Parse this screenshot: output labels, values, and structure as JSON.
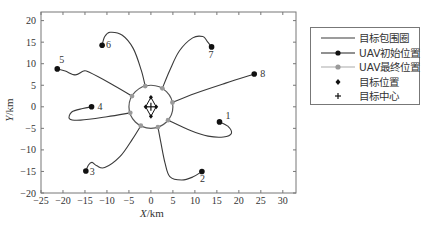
{
  "chart_data": {
    "type": "line",
    "title": "",
    "xlabel": "X/km",
    "ylabel": "Y/km",
    "xlim": [
      -25,
      33
    ],
    "ylim": [
      -20,
      22
    ],
    "xticks": [
      -25,
      -20,
      -15,
      -10,
      -5,
      0,
      5,
      10,
      15,
      20,
      25,
      30
    ],
    "yticks": [
      -20,
      -15,
      -10,
      -5,
      0,
      5,
      10,
      15,
      20
    ],
    "grid": false,
    "legend_position": "right-outside",
    "legend": [
      "目标包围圈",
      "UAV初始位置",
      "UAV最终位置",
      "目标位置",
      "目标中心"
    ],
    "encirclement_circle": {
      "center": [
        0,
        0
      ],
      "radius_km": 5
    },
    "target_center": [
      0,
      0
    ],
    "target_positions": [
      [
        0,
        2.2
      ],
      [
        0,
        -2.2
      ],
      [
        -1.2,
        0
      ],
      [
        1.2,
        0
      ]
    ],
    "uav_initial_positions": [
      {
        "id": "1",
        "x": 15.6,
        "y": -3.5
      },
      {
        "id": "2",
        "x": 11.6,
        "y": -15.0
      },
      {
        "id": "3",
        "x": -14.8,
        "y": -14.9
      },
      {
        "id": "4",
        "x": -13.5,
        "y": 0.0
      },
      {
        "id": "5",
        "x": -21.3,
        "y": 8.8
      },
      {
        "id": "6",
        "x": -11.1,
        "y": 14.3
      },
      {
        "id": "7",
        "x": 13.8,
        "y": 13.9
      },
      {
        "id": "8",
        "x": 23.5,
        "y": 7.6
      }
    ],
    "uav_final_positions": [
      {
        "id": "1",
        "x": 3.9,
        "y": -3.1
      },
      {
        "id": "2",
        "x": 1.6,
        "y": -4.7
      },
      {
        "id": "3",
        "x": -2.3,
        "y": -4.4
      },
      {
        "id": "4",
        "x": -4.7,
        "y": -1.4
      },
      {
        "id": "5",
        "x": -4.3,
        "y": 2.5
      },
      {
        "id": "6",
        "x": -1.3,
        "y": 4.8
      },
      {
        "id": "7",
        "x": 2.6,
        "y": 4.3
      },
      {
        "id": "8",
        "x": 4.9,
        "y": 1.0
      }
    ],
    "trajectories": [
      {
        "id": "1",
        "points": [
          [
            15.6,
            -3.5
          ],
          [
            17.5,
            -4.5
          ],
          [
            18.3,
            -6.2
          ],
          [
            16.5,
            -7.0
          ],
          [
            13,
            -6.8
          ],
          [
            9,
            -5.5
          ],
          [
            3.9,
            -3.1
          ]
        ]
      },
      {
        "id": "2",
        "points": [
          [
            11.6,
            -15.0
          ],
          [
            9.5,
            -16.3
          ],
          [
            7,
            -17.0
          ],
          [
            4.3,
            -16.2
          ],
          [
            3.2,
            -13
          ],
          [
            2.3,
            -8.5
          ],
          [
            1.6,
            -4.7
          ]
        ]
      },
      {
        "id": "3",
        "points": [
          [
            -14.8,
            -14.9
          ],
          [
            -14.2,
            -13.5
          ],
          [
            -13.4,
            -12.9
          ],
          [
            -12.3,
            -13.7
          ],
          [
            -10.5,
            -14.1
          ],
          [
            -7,
            -11.5
          ],
          [
            -4.2,
            -7.5
          ],
          [
            -2.3,
            -4.4
          ]
        ]
      },
      {
        "id": "4",
        "points": [
          [
            -13.5,
            0.0
          ],
          [
            -15.5,
            -0.4
          ],
          [
            -18,
            -1.2
          ],
          [
            -18.5,
            -2.8
          ],
          [
            -16,
            -3.1
          ],
          [
            -10,
            -2.3
          ],
          [
            -4.7,
            -1.4
          ]
        ]
      },
      {
        "id": "5",
        "points": [
          [
            -21.3,
            8.8
          ],
          [
            -19.5,
            8.3
          ],
          [
            -17.2,
            7.4
          ],
          [
            -15.3,
            8.3
          ],
          [
            -14.0,
            8.0
          ],
          [
            -9,
            5.3
          ],
          [
            -4.3,
            2.5
          ]
        ]
      },
      {
        "id": "6",
        "points": [
          [
            -11.1,
            14.3
          ],
          [
            -10.5,
            16.3
          ],
          [
            -9.3,
            17.3
          ],
          [
            -6.5,
            16.6
          ],
          [
            -4,
            13.5
          ],
          [
            -2.2,
            8.5
          ],
          [
            -1.3,
            4.8
          ]
        ]
      },
      {
        "id": "7",
        "points": [
          [
            13.8,
            13.9
          ],
          [
            12.8,
            15.2
          ],
          [
            11.8,
            16.3
          ],
          [
            9.5,
            16.0
          ],
          [
            6.5,
            13.0
          ],
          [
            4.3,
            8.5
          ],
          [
            2.6,
            4.3
          ]
        ]
      },
      {
        "id": "8",
        "points": [
          [
            23.5,
            7.6
          ],
          [
            17,
            5.5
          ],
          [
            10,
            3.1
          ],
          [
            4.9,
            1.0
          ]
        ]
      }
    ]
  },
  "axes": {
    "x_title_var": "X",
    "x_title_unit": "/km",
    "y_title_var": "Y",
    "y_title_unit": "/km"
  },
  "legend": {
    "items": [
      {
        "label": "目标包围圈",
        "symbol": "line-black"
      },
      {
        "label": "UAV初始位置",
        "symbol": "line-black-dot"
      },
      {
        "label": "UAV最终位置",
        "symbol": "line-gray-dot"
      },
      {
        "label": "目标位置",
        "symbol": "diamond-black"
      },
      {
        "label": "目标中心",
        "symbol": "plus-black"
      }
    ]
  },
  "colors": {
    "trajectory": "#3a3a3a",
    "initial_marker": "#111111",
    "final_marker": "#9a9a9a",
    "axis": "#777777",
    "text": "#333333"
  }
}
